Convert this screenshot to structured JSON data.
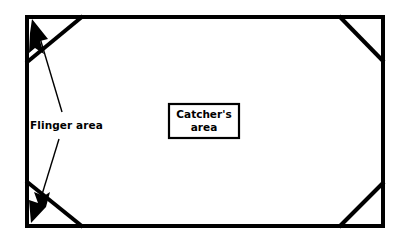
{
  "diagram": {
    "background_color": "#ffffff",
    "line_color": "#000000",
    "field": {
      "name": "playfield-boundary",
      "x": 25,
      "y": 15,
      "width": 360,
      "height": 213,
      "stroke_width": 4
    },
    "labels": {
      "flinger": "Flinger area",
      "catcher_line1": "Catcher's",
      "catcher_line2": "area"
    },
    "catcher_box": {
      "x": 168,
      "y": 103,
      "width": 72,
      "height": 36
    },
    "corners": [
      {
        "name": "top-left",
        "x1": 25,
        "y1": 62,
        "x2": 82,
        "y2": 15
      },
      {
        "name": "top-right",
        "x1": 340,
        "y1": 15,
        "x2": 385,
        "y2": 61
      },
      {
        "name": "bottom-left",
        "x1": 25,
        "y1": 182,
        "x2": 82,
        "y2": 228
      },
      {
        "name": "bottom-right",
        "x1": 340,
        "y1": 228,
        "x2": 385,
        "y2": 183
      }
    ],
    "arrows": [
      {
        "name": "upper-flinger-arrow",
        "tip_x": 33,
        "tip_y": 20,
        "tail_x": 60,
        "tail_y": 110
      },
      {
        "name": "lower-flinger-arrow",
        "tip_x": 33,
        "tip_y": 222,
        "tail_x": 58,
        "tail_y": 138
      }
    ]
  }
}
